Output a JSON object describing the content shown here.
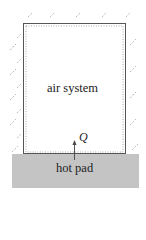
{
  "diagram": {
    "system_label": "air system",
    "heat_label": "Q",
    "pad_label": "hot pad",
    "colors": {
      "boundary": "#555555",
      "hatch": "#9a9a9a",
      "pad_fill": "#c4c4c4",
      "text": "#222222"
    }
  }
}
